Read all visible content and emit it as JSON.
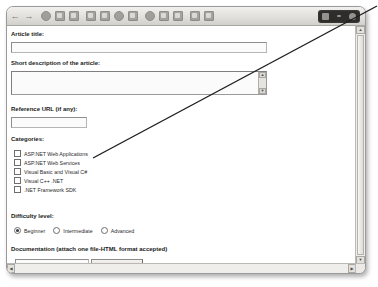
{
  "window": {
    "toolbar": {
      "icons": [
        "back-arrow-icon",
        "forward-arrow-icon",
        "stop-icon",
        "refresh-icon",
        "home-icon",
        "search-icon",
        "favorites-icon",
        "history-icon",
        "mail-icon",
        "print-icon",
        "edit-icon",
        "discuss-icon",
        "messenger-icon",
        "page-icon",
        "folder-icon",
        "person-icon"
      ],
      "right_panel_icons": [
        "grid-icon",
        "dash-icon",
        "circle-icon"
      ]
    }
  },
  "form": {
    "title_label": "Article title:",
    "title_value": "",
    "description_label": "Short description of the article:",
    "description_value": "",
    "reference_label": "Reference URL (if any):",
    "reference_value": "",
    "categories_label": "Categories:",
    "categories": [
      {
        "label": "ASP.NET Web Applications",
        "checked": false
      },
      {
        "label": "ASP.NET Web Services",
        "checked": false
      },
      {
        "label": "Visual Basic and Visual C#",
        "checked": false
      },
      {
        "label": "Visual C++ .NET",
        "checked": false
      },
      {
        "label": ".NET Framework SDK",
        "checked": false
      }
    ],
    "difficulty_label": "Difficulty level:",
    "difficulty_options": [
      {
        "label": "Beginner",
        "selected": true
      },
      {
        "label": "Intermediate",
        "selected": false
      },
      {
        "label": "Advanced",
        "selected": false
      }
    ],
    "documentation_label": "Documentation (attach one file-HTML format accepted)",
    "documentation_value": "",
    "browse_label": "Browse..."
  },
  "scrollbars": {
    "vertical": {
      "up_glyph": "▲",
      "down_glyph": "▼"
    },
    "horizontal": {
      "left_glyph": "◀",
      "right_glyph": "▶"
    },
    "textarea": {
      "up_glyph": "▲",
      "down_glyph": "▼"
    }
  },
  "annotation": {
    "name": "callout-line"
  },
  "colors": {
    "frame_border": "#9a9a9a",
    "toolbar_bg": "#e2e0dc",
    "dark_panel": "#2e2d2b",
    "text": "#1a1a1a",
    "annotation_line": "#1d1d1d"
  }
}
